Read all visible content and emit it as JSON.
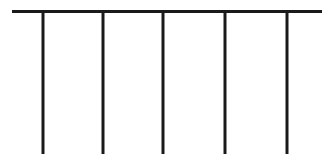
{
  "figure": {
    "canvas": {
      "width": 335,
      "height": 166,
      "background_color": "#ffffff"
    },
    "stroke": {
      "color": "#1a1a1a",
      "rail_width": 3,
      "post_width": 3
    },
    "rail": {
      "name": "horizontal-rail",
      "x_start": 12,
      "x_end": 322,
      "y": 11.5,
      "length": 310
    },
    "posts": [
      {
        "name": "post-1",
        "x": 43,
        "y_top": 11,
        "y_bottom": 154,
        "height": 143
      },
      {
        "name": "post-2",
        "x": 103,
        "y_top": 11,
        "y_bottom": 154,
        "height": 143
      },
      {
        "name": "post-3",
        "x": 163,
        "y_top": 11,
        "y_bottom": 154,
        "height": 143
      },
      {
        "name": "post-4",
        "x": 225,
        "y_top": 11,
        "y_bottom": 154,
        "height": 143
      },
      {
        "name": "post-5",
        "x": 287,
        "y_top": 11,
        "y_bottom": 154,
        "height": 143
      }
    ],
    "post_count": 5
  }
}
